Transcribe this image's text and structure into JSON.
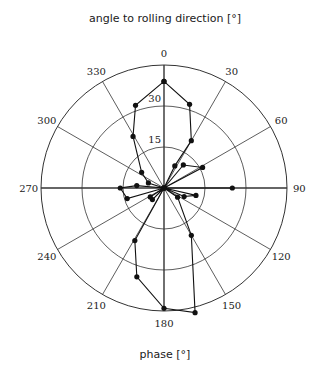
{
  "chart_data": {
    "type": "polar-line",
    "title": "angle to rolling direction [°]",
    "xlabel": "phase [°]",
    "ylabel": "",
    "angular_ticks": [
      "0",
      "30",
      "60",
      "90",
      "120",
      "150",
      "180",
      "210",
      "240",
      "270",
      "300",
      "330"
    ],
    "radial_ticks": [
      "15",
      "30"
    ],
    "radial_range": [
      0,
      45
    ],
    "grid": true,
    "series": [
      {
        "name": "phase",
        "points": [
          {
            "angle": 0,
            "r": 39
          },
          {
            "angle": 17,
            "r": 32
          },
          {
            "angle": 30,
            "r": 20
          },
          {
            "angle": 26,
            "r": 9
          },
          {
            "angle": 0,
            "r": 0
          },
          {
            "angle": 40,
            "r": 11
          },
          {
            "angle": 62,
            "r": 16
          },
          {
            "angle": 90,
            "r": 0
          },
          {
            "angle": 90,
            "r": 25
          },
          {
            "angle": 0,
            "r": 0
          },
          {
            "angle": 103,
            "r": 12
          },
          {
            "angle": 113,
            "r": 8
          },
          {
            "angle": 0,
            "r": 0
          },
          {
            "angle": 124,
            "r": 6
          },
          {
            "angle": 150,
            "r": 20
          },
          {
            "angle": 166,
            "r": 47
          },
          {
            "angle": 180,
            "r": 44
          },
          {
            "angle": 197,
            "r": 34
          },
          {
            "angle": 209,
            "r": 22
          },
          {
            "angle": 0,
            "r": 0
          },
          {
            "angle": 225,
            "r": 6
          },
          {
            "angle": 237,
            "r": 6
          },
          {
            "angle": 0,
            "r": 0
          },
          {
            "angle": 254,
            "r": 14
          },
          {
            "angle": 270,
            "r": 16
          },
          {
            "angle": 275,
            "r": 10
          },
          {
            "angle": 0,
            "r": 0
          },
          {
            "angle": 288,
            "r": 6
          },
          {
            "angle": 305,
            "r": 10
          },
          {
            "angle": 329,
            "r": 22
          },
          {
            "angle": 341,
            "r": 32
          },
          {
            "angle": 0,
            "r": 39
          }
        ]
      }
    ]
  }
}
